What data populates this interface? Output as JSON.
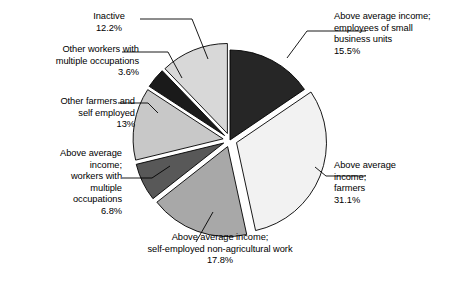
{
  "chart_data": {
    "type": "pie",
    "title": "",
    "subtitle": "",
    "xlabel": "",
    "ylabel": "",
    "legend_position": "none",
    "grid": false,
    "units": "percent",
    "categories": [
      "Above average income; employees of small business units",
      "Above average income; farmers",
      "Above average income; self-employed non-agricultural work",
      "Above average income; workers with multiple occupations",
      "Other farmers and self employed",
      "Other workers with multiple occupations",
      "Inactive"
    ],
    "values": [
      15.5,
      31.1,
      17.8,
      6.8,
      13,
      3.6,
      12.2
    ],
    "value_labels": [
      "15.5%",
      "31.1%",
      "17.8%",
      "6.8%",
      "13%",
      "3.6%",
      "12.2%"
    ],
    "colors": [
      "#262626",
      "#f2f2f2",
      "#a8a8a8",
      "#585858",
      "#c8c8c8",
      "#1a1a1a",
      "#d8d8d8"
    ],
    "slice_edge_color": "#000000",
    "slices": [
      {
        "id": "small-business",
        "label_lines": [
          "Above average income;",
          "employees of small",
          "business units"
        ],
        "percent_label": "15.5%",
        "value": 15.5,
        "color": "#262626",
        "exploded": false
      },
      {
        "id": "farmers",
        "label_lines": [
          "Above average",
          "income;",
          "farmers"
        ],
        "percent_label": "31.1%",
        "value": 31.1,
        "color": "#f2f2f2",
        "exploded": true
      },
      {
        "id": "self-employed-nonagri",
        "label_lines": [
          "Above average income;",
          "self-employed non-agricultural work"
        ],
        "percent_label": "17.8%",
        "value": 17.8,
        "color": "#a8a8a8",
        "exploded": true
      },
      {
        "id": "workers-multiple",
        "label_lines": [
          "Above average",
          "income;",
          "workers with",
          "multiple",
          "occupations"
        ],
        "percent_label": "6.8%",
        "value": 6.8,
        "color": "#585858",
        "exploded": true
      },
      {
        "id": "other-farmers",
        "label_lines": [
          "Other farmers and",
          "self employed"
        ],
        "percent_label": "13%",
        "value": 13,
        "color": "#c8c8c8",
        "exploded": true
      },
      {
        "id": "other-workers-multiple",
        "label_lines": [
          "Other workers with",
          "multiple occupations"
        ],
        "percent_label": "3.6%",
        "value": 3.6,
        "color": "#1a1a1a",
        "exploded": true
      },
      {
        "id": "inactive",
        "label_lines": [
          "Inactive"
        ],
        "percent_label": "12.2%",
        "value": 12.2,
        "color": "#d8d8d8",
        "exploded": true
      }
    ]
  },
  "labels": {
    "small_business": "Above average income;\nemployees of small\nbusiness units\n15.5%",
    "farmers": "Above average\nincome;\nfarmers\n31.1%",
    "self_employed": "Above average income;\nself-employed non-agricultural work\n17.8%",
    "workers_multiple": "Above average\nincome;\nworkers with\nmultiple\noccupations\n6.8%",
    "other_farmers": "Other farmers and\nself employed\n13%",
    "other_workers": "Other workers with\nmultiple occupations\n3.6%",
    "inactive": "Inactive\n12.2%"
  }
}
